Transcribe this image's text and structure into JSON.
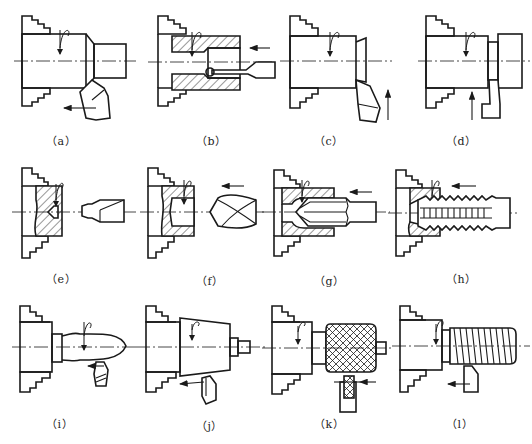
{
  "figure": {
    "panels": [
      {
        "id": "a",
        "label": "（a）",
        "operation": "turning outer cylinder / chamfer"
      },
      {
        "id": "b",
        "label": "（b）",
        "operation": "boring"
      },
      {
        "id": "c",
        "label": "（c）",
        "operation": "facing"
      },
      {
        "id": "d",
        "label": "（d）",
        "operation": "grooving / parting"
      },
      {
        "id": "e",
        "label": "（e）",
        "operation": "center drilling"
      },
      {
        "id": "f",
        "label": "（f）",
        "operation": "drilling"
      },
      {
        "id": "g",
        "label": "（g）",
        "operation": "reaming"
      },
      {
        "id": "h",
        "label": "（h）",
        "operation": "tapping"
      },
      {
        "id": "i",
        "label": "（i）",
        "operation": "form turning"
      },
      {
        "id": "j",
        "label": "（j）",
        "operation": "taper turning"
      },
      {
        "id": "k",
        "label": "（k）",
        "operation": "knurling"
      },
      {
        "id": "l",
        "label": "（l）",
        "operation": "thread turning"
      }
    ]
  }
}
